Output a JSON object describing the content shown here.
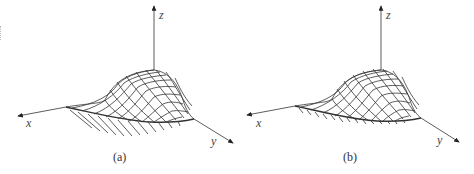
{
  "figure": {
    "panels": [
      {
        "id": "a",
        "caption": "(a)",
        "axes": {
          "x": "x",
          "y": "y",
          "z": "z"
        },
        "description": "3D wireframe surface with overhanging ribs below the near edge"
      },
      {
        "id": "b",
        "caption": "(b)",
        "axes": {
          "x": "x",
          "y": "y",
          "z": "z"
        },
        "description": "3D wireframe surface with short ticks along the near edge"
      }
    ],
    "colors": {
      "line": "#333333",
      "background": "#ffffff"
    }
  }
}
